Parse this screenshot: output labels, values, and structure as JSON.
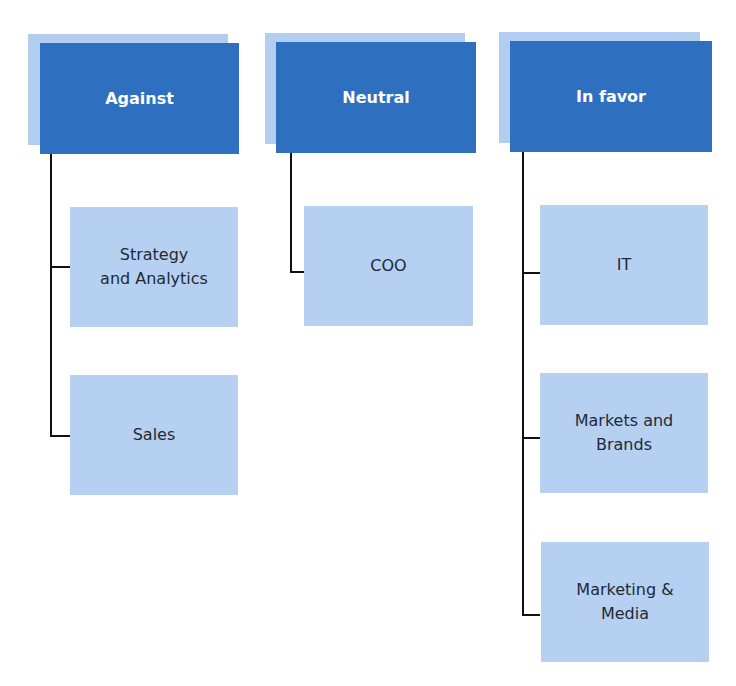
{
  "colors": {
    "header": "#2f6fbf",
    "header_shadow": "#b3cdf0",
    "child": "#b6d0f2",
    "connector": "#111111"
  },
  "columns": [
    {
      "title": "Against",
      "items": [
        {
          "label": "Strategy\nand Analytics"
        },
        {
          "label": "Sales"
        }
      ]
    },
    {
      "title": "Neutral",
      "items": [
        {
          "label": "COO"
        }
      ]
    },
    {
      "title": "In favor",
      "items": [
        {
          "label": "IT"
        },
        {
          "label": "Markets and\nBrands"
        },
        {
          "label": "Marketing &\nMedia"
        }
      ]
    }
  ]
}
